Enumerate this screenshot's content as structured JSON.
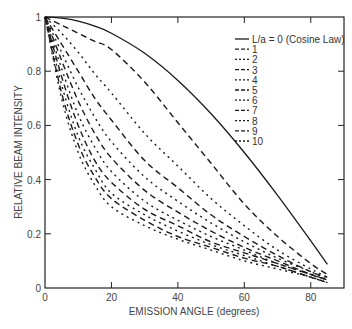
{
  "chart_data": {
    "type": "line",
    "title": "",
    "xlabel": "EMISSION ANGLE (degrees)",
    "ylabel": "RELATIVE BEAM INTENSITY",
    "xlim": [
      0,
      90
    ],
    "ylim": [
      0,
      1
    ],
    "xticks": [
      0,
      20,
      40,
      60,
      80
    ],
    "xtick_labels": [
      "0",
      "20",
      "40",
      "60",
      "80"
    ],
    "yticks": [
      0,
      0.2,
      0.4,
      0.6,
      0.8,
      1
    ],
    "ytick_labels": [
      "0",
      "0.2",
      "0.4",
      "0.6",
      "0.8",
      "1"
    ],
    "grid": false,
    "legend_position": "upper right",
    "x": [
      0,
      5,
      10,
      15,
      20,
      30,
      40,
      50,
      60,
      70,
      80,
      85
    ],
    "series": [
      {
        "name": "L/a = 0 (Cosine Law)",
        "style": "solid",
        "values": [
          1,
          0.996,
          0.985,
          0.966,
          0.94,
          0.866,
          0.766,
          0.643,
          0.5,
          0.342,
          0.174,
          0.087
        ]
      },
      {
        "name": "1",
        "style": "long-dash",
        "values": [
          1,
          0.97,
          0.94,
          0.91,
          0.88,
          0.76,
          0.61,
          0.46,
          0.31,
          0.19,
          0.09,
          0.05
        ]
      },
      {
        "name": "2",
        "style": "dot",
        "values": [
          1,
          0.94,
          0.87,
          0.79,
          0.72,
          0.57,
          0.45,
          0.33,
          0.23,
          0.14,
          0.07,
          0.04
        ]
      },
      {
        "name": "3",
        "style": "long-dash",
        "values": [
          1,
          0.9,
          0.8,
          0.7,
          0.62,
          0.47,
          0.37,
          0.27,
          0.19,
          0.12,
          0.06,
          0.04
        ]
      },
      {
        "name": "4",
        "style": "dot",
        "values": [
          1,
          0.87,
          0.74,
          0.63,
          0.54,
          0.41,
          0.32,
          0.24,
          0.17,
          0.11,
          0.06,
          0.03
        ]
      },
      {
        "name": "5",
        "style": "long-dash",
        "values": [
          1,
          0.84,
          0.69,
          0.57,
          0.48,
          0.36,
          0.28,
          0.21,
          0.15,
          0.1,
          0.05,
          0.03
        ]
      },
      {
        "name": "6",
        "style": "dot",
        "values": [
          1,
          0.81,
          0.64,
          0.52,
          0.43,
          0.32,
          0.25,
          0.19,
          0.14,
          0.09,
          0.05,
          0.03
        ]
      },
      {
        "name": "7",
        "style": "long-dash",
        "values": [
          1,
          0.78,
          0.6,
          0.47,
          0.39,
          0.29,
          0.23,
          0.17,
          0.13,
          0.09,
          0.05,
          0.03
        ]
      },
      {
        "name": "8",
        "style": "dot",
        "values": [
          1,
          0.75,
          0.56,
          0.44,
          0.35,
          0.27,
          0.21,
          0.16,
          0.12,
          0.08,
          0.04,
          0.02
        ]
      },
      {
        "name": "9",
        "style": "long-dash",
        "values": [
          1,
          0.72,
          0.53,
          0.41,
          0.33,
          0.25,
          0.19,
          0.15,
          0.11,
          0.08,
          0.04,
          0.02
        ]
      },
      {
        "name": "10",
        "style": "dot",
        "values": [
          1,
          0.7,
          0.5,
          0.38,
          0.3,
          0.23,
          0.18,
          0.14,
          0.1,
          0.07,
          0.04,
          0.02
        ]
      }
    ]
  },
  "style": {
    "line_color": "#1a1a1a",
    "axis_color": "#222222",
    "text_color": "#444444",
    "background": "#ffffff"
  }
}
